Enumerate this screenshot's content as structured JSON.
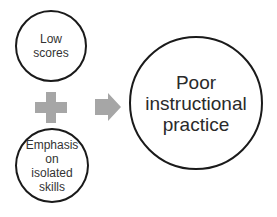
{
  "diagram": {
    "nodes": [
      {
        "id": "low-scores",
        "label": "Low\nscores"
      },
      {
        "id": "emphasis",
        "label": "Emphasis\non\nisolated\nskills"
      },
      {
        "id": "poor-practice",
        "label": "Poor\ninstructional\npractice"
      }
    ],
    "operators": [
      {
        "type": "plus",
        "color": "#a6a6a6"
      },
      {
        "type": "arrow-right",
        "color": "#a6a6a6"
      }
    ],
    "colors": {
      "stroke": "#1a1a1a",
      "shape_fill": "#a6a6a6",
      "background": "#ffffff"
    }
  }
}
